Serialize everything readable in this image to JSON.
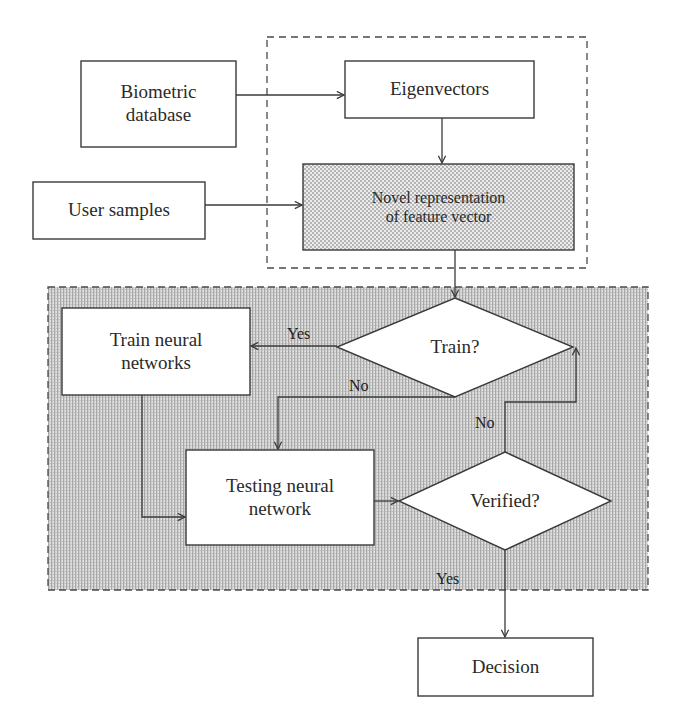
{
  "diagram": {
    "type": "flowchart",
    "colors": {
      "stroke": "#3a3a3a",
      "background": "#ffffff",
      "shade_dark": "#bdbdbd",
      "shade_light": "#e6e6e6",
      "node_fill": "#ffffff"
    },
    "groups": [
      {
        "id": "feature-extraction-group",
        "style": "dashed",
        "fill": "none"
      },
      {
        "id": "neural-network-group",
        "style": "dashed",
        "fill": "shaded"
      }
    ],
    "nodes": {
      "biometric_database": {
        "label": "Biometric\ndatabase",
        "shape": "rectangle"
      },
      "eigenvectors": {
        "label": "Eigenvectors",
        "shape": "rectangle"
      },
      "user_samples": {
        "label": "User samples",
        "shape": "rectangle"
      },
      "novel_representation": {
        "label": "Novel representation\nof feature vector",
        "shape": "rectangle",
        "fill": "dotted"
      },
      "train_decision": {
        "label": "Train?",
        "shape": "diamond"
      },
      "train_neural_networks": {
        "label": "Train neural\nnetworks",
        "shape": "rectangle"
      },
      "testing_neural_network": {
        "label": "Testing neural\nnetwork",
        "shape": "rectangle"
      },
      "verified_decision": {
        "label": "Verified?",
        "shape": "diamond"
      },
      "decision": {
        "label": "Decision",
        "shape": "rectangle"
      }
    },
    "edges": [
      {
        "from": "biometric_database",
        "to": "eigenvectors",
        "label": ""
      },
      {
        "from": "eigenvectors",
        "to": "novel_representation",
        "label": ""
      },
      {
        "from": "user_samples",
        "to": "novel_representation",
        "label": ""
      },
      {
        "from": "novel_representation",
        "to": "train_decision",
        "label": ""
      },
      {
        "from": "train_decision",
        "to": "train_neural_networks",
        "label": "Yes"
      },
      {
        "from": "train_decision",
        "to": "testing_neural_network",
        "label": "No"
      },
      {
        "from": "train_neural_networks",
        "to": "testing_neural_network",
        "label": ""
      },
      {
        "from": "testing_neural_network",
        "to": "verified_decision",
        "label": ""
      },
      {
        "from": "verified_decision",
        "to": "train_decision",
        "label": "No"
      },
      {
        "from": "verified_decision",
        "to": "decision",
        "label": "Yes"
      }
    ],
    "edge_labels": {
      "train_yes": "Yes",
      "train_no": "No",
      "verified_no": "No",
      "verified_yes": "Yes"
    }
  }
}
